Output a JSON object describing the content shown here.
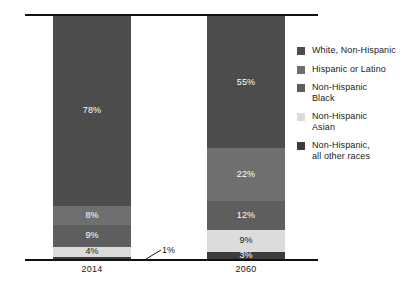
{
  "chart_data": {
    "type": "bar",
    "subtype": "stacked-100-percent",
    "title": "",
    "subtitle": "",
    "xlabel": "",
    "ylabel": "",
    "ylim": [
      0,
      100
    ],
    "grid": false,
    "legend_position": "right",
    "categories": [
      "2014",
      "2060"
    ],
    "series": [
      {
        "name": "White, Non-Hispanic",
        "color": "#4c4c4c",
        "values": [
          78,
          55
        ]
      },
      {
        "name": "Hispanic or Latino",
        "color": "#6f6f6f",
        "values": [
          8,
          22
        ]
      },
      {
        "name": "Non-Hispanic Black",
        "color": "#5e5e5e",
        "values": [
          9,
          12
        ]
      },
      {
        "name": "Non-Hispanic Asian",
        "color": "#dcdcdc",
        "values": [
          4,
          9
        ]
      },
      {
        "name": "Non-Hispanic, all other races",
        "color": "#3c3c3c",
        "values": [
          1,
          3
        ]
      }
    ],
    "annotations": [
      {
        "text": "1%",
        "refers_to": "2014 Non-Hispanic, all other races",
        "leader_line": true
      }
    ]
  },
  "axes": {
    "top_rule": true,
    "bottom_rule": true
  },
  "bars": {
    "b2014": {
      "category": "2014",
      "segments": [
        {
          "key": "white",
          "label": "78%",
          "value": 78,
          "color": "#4c4c4c",
          "label_color": "on-dark",
          "label_visible": true
        },
        {
          "key": "hisp",
          "label": "8%",
          "value": 8,
          "color": "#6f6f6f",
          "label_color": "on-dark",
          "label_visible": true
        },
        {
          "key": "black",
          "label": "9%",
          "value": 9,
          "color": "#5e5e5e",
          "label_color": "on-dark",
          "label_visible": true
        },
        {
          "key": "asian",
          "label": "4%",
          "value": 4,
          "color": "#dcdcdc",
          "label_color": "on-light",
          "label_visible": true
        },
        {
          "key": "other",
          "label": "1%",
          "value": 1,
          "color": "#3c3c3c",
          "label_color": "on-dark",
          "label_visible": false
        }
      ]
    },
    "b2060": {
      "category": "2060",
      "segments": [
        {
          "key": "white",
          "label": "55%",
          "value": 55,
          "color": "#4c4c4c",
          "label_color": "on-dark",
          "label_visible": true
        },
        {
          "key": "hisp",
          "label": "22%",
          "value": 22,
          "color": "#6f6f6f",
          "label_color": "on-dark",
          "label_visible": true
        },
        {
          "key": "black",
          "label": "12%",
          "value": 12,
          "color": "#5e5e5e",
          "label_color": "on-dark",
          "label_visible": true
        },
        {
          "key": "asian",
          "label": "9%",
          "value": 9,
          "color": "#dcdcdc",
          "label_color": "on-light",
          "label_visible": true
        },
        {
          "key": "other",
          "label": "3%",
          "value": 3,
          "color": "#3c3c3c",
          "label_color": "on-dark",
          "label_visible": true
        }
      ]
    }
  },
  "category_labels": {
    "left": "2014",
    "right": "2060"
  },
  "callout": {
    "text": "1%"
  },
  "legend": {
    "items": [
      {
        "label": "White, Non-Hispanic",
        "color": "#4c4c4c"
      },
      {
        "label": "Hispanic or Latino",
        "color": "#6f6f6f"
      },
      {
        "label": "Non-Hispanic\nBlack",
        "color": "#5e5e5e"
      },
      {
        "label": "Non-Hispanic\nAsian",
        "color": "#dcdcdc"
      },
      {
        "label": "Non-Hispanic,\nall other races",
        "color": "#3c3c3c"
      }
    ]
  }
}
